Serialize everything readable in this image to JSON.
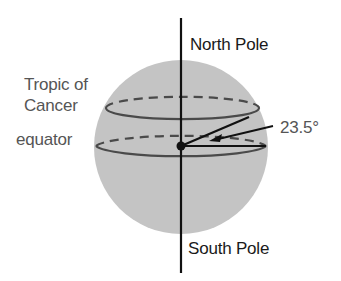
{
  "diagram": {
    "labels": {
      "north_pole": "North Pole",
      "south_pole": "South Pole",
      "tropic_line1": "Tropic of",
      "tropic_line2": "Cancer",
      "equator": "equator",
      "angle": "23.5°"
    },
    "colors": {
      "sphere": "#c4c4c4",
      "axis": "#111111",
      "circle_line": "#4a4a4a",
      "label_dark": "#1a1a1a",
      "label_grey": "#555555"
    },
    "angle_degrees": 23.5
  }
}
